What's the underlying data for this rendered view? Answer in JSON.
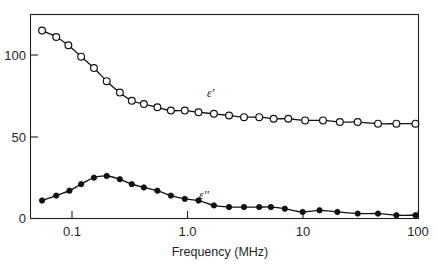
{
  "chart_data": {
    "type": "scatter",
    "title": "",
    "subtitle": "",
    "xlabel": "Frequency (MHz)",
    "ylabel": "",
    "xscale": "log",
    "yscale": "linear",
    "xlim": [
      0.05,
      100
    ],
    "ylim": [
      0,
      130
    ],
    "xticks": [
      0.1,
      1.0,
      10,
      100
    ],
    "xtick_labels": [
      "0.1",
      "1.0",
      "10",
      "100"
    ],
    "yticks": [
      0,
      50,
      100
    ],
    "ytick_labels": [
      "0",
      "50",
      "100"
    ],
    "grid": false,
    "legend_position": "inline-annotation",
    "annotations": [
      {
        "text": "ε'",
        "x": 1.45,
        "y": 76,
        "series": "eps_prime"
      },
      {
        "text": "ε''",
        "x": 1.6,
        "y": 19,
        "series": "eps_double_prime"
      }
    ],
    "series": [
      {
        "name": "ε'",
        "marker": "open-circle",
        "label": "ε'",
        "x": [
          0.055,
          0.073,
          0.093,
          0.12,
          0.155,
          0.2,
          0.26,
          0.33,
          0.42,
          0.55,
          0.72,
          0.95,
          1.25,
          1.7,
          2.3,
          3.1,
          4.2,
          5.6,
          7.5,
          10.5,
          15,
          21,
          30,
          45,
          65,
          95
        ],
        "y": [
          115,
          111,
          106,
          99,
          92,
          84,
          77,
          72,
          70,
          68,
          66,
          66,
          65,
          64,
          63,
          62,
          62,
          61,
          61,
          60,
          60,
          59,
          59,
          58,
          58,
          58
        ]
      },
      {
        "name": "ε''",
        "marker": "filled-circle",
        "label": "ε''",
        "x": [
          0.055,
          0.073,
          0.095,
          0.12,
          0.155,
          0.2,
          0.26,
          0.33,
          0.42,
          0.55,
          0.72,
          0.95,
          1.25,
          1.7,
          2.3,
          3.1,
          4.2,
          5.3,
          7.0,
          10.0,
          14,
          20,
          30,
          45,
          65,
          95
        ],
        "y": [
          11,
          14,
          17,
          21,
          25,
          26,
          24,
          21,
          19,
          17,
          14,
          12,
          11,
          8,
          7,
          7,
          7,
          7,
          6,
          4,
          5,
          4,
          3,
          3,
          2,
          2
        ]
      }
    ],
    "colors": {
      "axis": "#1f1f1f",
      "curve": "#111111",
      "open_marker_fill": "#ffffff",
      "filled_marker": "#111111",
      "background": "#ffffff"
    }
  },
  "figure": {
    "xlabel": "Frequency (MHz)",
    "eps_prime_label": "ε'",
    "eps_double_prime_label": "ε''",
    "xtick_0": "0.1",
    "xtick_1": "1.0",
    "xtick_2": "10",
    "xtick_3": "100",
    "ytick_0": "0",
    "ytick_1": "50",
    "ytick_2": "100"
  }
}
